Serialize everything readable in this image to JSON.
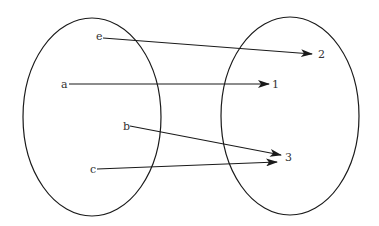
{
  "diagram": {
    "type": "mapping",
    "domain_set": {
      "ellipse": {
        "cx": 92,
        "cy": 117,
        "rx": 69,
        "ry": 99
      },
      "elements": [
        {
          "label": "e",
          "x": 96,
          "y": 40
        },
        {
          "label": "a",
          "x": 61,
          "y": 88
        },
        {
          "label": "b",
          "x": 123,
          "y": 130
        },
        {
          "label": "c",
          "x": 90,
          "y": 173
        }
      ]
    },
    "codomain_set": {
      "ellipse": {
        "cx": 290,
        "cy": 116,
        "rx": 69,
        "ry": 99
      },
      "elements": [
        {
          "label": "2",
          "x": 318,
          "y": 58
        },
        {
          "label": "1",
          "x": 272,
          "y": 88
        },
        {
          "label": "3",
          "x": 285,
          "y": 161
        }
      ]
    },
    "mappings": [
      {
        "from": "e",
        "to": "2",
        "x1": 103,
        "y1": 38,
        "x2": 312,
        "y2": 54
      },
      {
        "from": "a",
        "to": "1",
        "x1": 69,
        "y1": 84,
        "x2": 269,
        "y2": 84
      },
      {
        "from": "b",
        "to": "3",
        "x1": 130,
        "y1": 126,
        "x2": 281,
        "y2": 155
      },
      {
        "from": "c",
        "to": "3",
        "x1": 97,
        "y1": 169,
        "x2": 277,
        "y2": 162
      }
    ],
    "colors": {
      "stroke": "#1a1a1a",
      "text": "#333333"
    }
  }
}
